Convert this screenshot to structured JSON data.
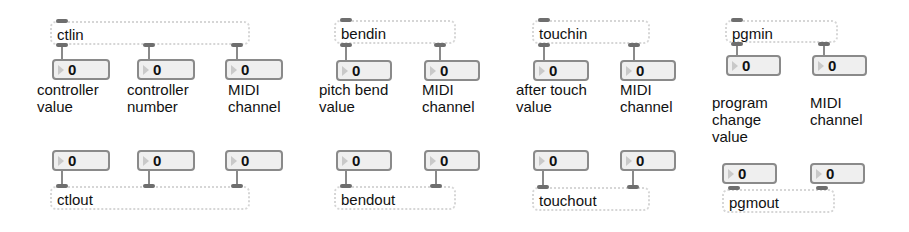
{
  "patcher": {
    "groups": [
      {
        "in_object": "ctlin",
        "out_object": "ctlout",
        "outlets": [
          {
            "value": "0",
            "label": "controller\nvalue"
          },
          {
            "value": "0",
            "label": "controller\nnumber"
          },
          {
            "value": "0",
            "label": "MIDI\nchannel"
          }
        ],
        "inlets": [
          {
            "value": "0"
          },
          {
            "value": "0"
          },
          {
            "value": "0"
          }
        ]
      },
      {
        "in_object": "bendin",
        "out_object": "bendout",
        "outlets": [
          {
            "value": "0",
            "label": "pitch bend\nvalue"
          },
          {
            "value": "0",
            "label": "MIDI\nchannel"
          }
        ],
        "inlets": [
          {
            "value": "0"
          },
          {
            "value": "0"
          }
        ]
      },
      {
        "in_object": "touchin",
        "out_object": "touchout",
        "outlets": [
          {
            "value": "0",
            "label": "after touch\nvalue"
          },
          {
            "value": "0",
            "label": "MIDI\nchannel"
          }
        ],
        "inlets": [
          {
            "value": "0"
          },
          {
            "value": "0"
          }
        ]
      },
      {
        "in_object": "pgmin",
        "out_object": "pgmout",
        "outlets": [
          {
            "value": "0",
            "label": "program\nchange\nvalue"
          },
          {
            "value": "0",
            "label": "MIDI\nchannel"
          }
        ],
        "inlets": [
          {
            "value": "0"
          },
          {
            "value": "0"
          }
        ]
      }
    ]
  },
  "colors": {
    "object_border": "#d6d6d6",
    "number_border": "#8a8a8a",
    "number_bg": "#efefef",
    "port": "#6e6e6e",
    "triangle": "#c9c9c9"
  }
}
